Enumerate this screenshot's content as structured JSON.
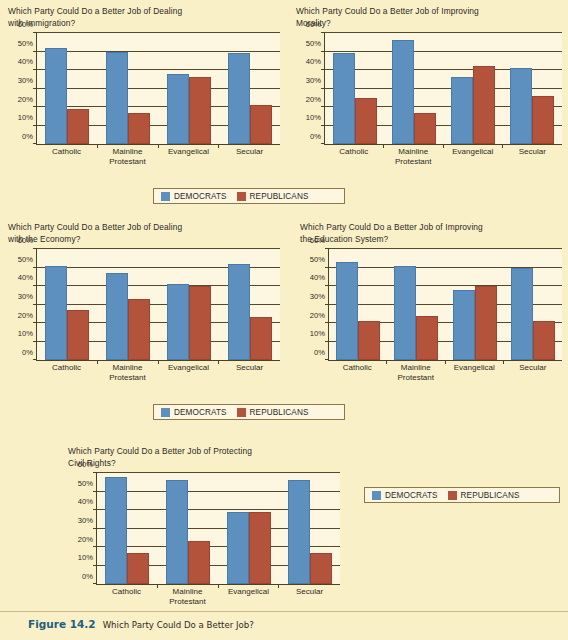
{
  "figure": {
    "number_label": "Figure 14.2",
    "caption": "Which Party Could Do a Better Job?"
  },
  "legend": {
    "democrats_label": "DEMOCRATS",
    "republicans_label": "REPUBLICANS",
    "democrats_color": "#5d8fbf",
    "republicans_color": "#b4533c"
  },
  "axis": {
    "y_ticks": [
      "60%",
      "50%",
      "40%",
      "30%",
      "20%",
      "10%",
      "0%"
    ],
    "y_min": 0,
    "y_max": 60,
    "categories": [
      "Catholic",
      "Mainline\nProtestant",
      "Evangelical",
      "Secular"
    ]
  },
  "chart_data": [
    {
      "type": "bar",
      "id": "immigration",
      "title": "Which Party Could Do a Better Job of Dealing\nwith Immigration?",
      "categories": [
        "Catholic",
        "Mainline\nProtestant",
        "Evangelical",
        "Secular"
      ],
      "series": [
        {
          "name": "DEMOCRATS",
          "color": "#5d8fbf",
          "values": [
            52,
            50,
            38,
            49
          ]
        },
        {
          "name": "REPUBLICANS",
          "color": "#b4533c",
          "values": [
            19,
            17,
            36,
            21
          ]
        }
      ],
      "xlabel": "",
      "ylabel": "",
      "ylim": [
        0,
        60
      ],
      "yticks": [
        0,
        10,
        20,
        30,
        40,
        50,
        60
      ],
      "grid": true,
      "legend_position": "below-center"
    },
    {
      "type": "bar",
      "id": "morality",
      "title": "Which Party Could Do a Better Job of  Improving\nMorality?",
      "categories": [
        "Catholic",
        "Mainline\nProtestant",
        "Evangelical",
        "Secular"
      ],
      "series": [
        {
          "name": "DEMOCRATS",
          "color": "#5d8fbf",
          "values": [
            49,
            56,
            36,
            41
          ]
        },
        {
          "name": "REPUBLICANS",
          "color": "#b4533c",
          "values": [
            25,
            17,
            42,
            26
          ]
        }
      ],
      "xlabel": "",
      "ylabel": "",
      "ylim": [
        0,
        60
      ],
      "yticks": [
        0,
        10,
        20,
        30,
        40,
        50,
        60
      ],
      "grid": true,
      "legend_position": "below-center"
    },
    {
      "type": "bar",
      "id": "economy",
      "title": "Which Party Could Do a Better Job of Dealing\nwith the Economy?",
      "categories": [
        "Catholic",
        "Mainline\nProtestant",
        "Evangelical",
        "Secular"
      ],
      "series": [
        {
          "name": "DEMOCRATS",
          "color": "#5d8fbf",
          "values": [
            51,
            47,
            41,
            52
          ]
        },
        {
          "name": "REPUBLICANS",
          "color": "#b4533c",
          "values": [
            27,
            33,
            40,
            23
          ]
        }
      ],
      "xlabel": "",
      "ylabel": "",
      "ylim": [
        0,
        60
      ],
      "yticks": [
        0,
        10,
        20,
        30,
        40,
        50,
        60
      ],
      "grid": true,
      "legend_position": "below-center"
    },
    {
      "type": "bar",
      "id": "education",
      "title": "Which Party Could Do a  Better Job of  Improving\nthe  Education System?",
      "categories": [
        "Catholic",
        "Mainline\nProtestant",
        "Evangelical",
        "Secular"
      ],
      "series": [
        {
          "name": "DEMOCRATS",
          "color": "#5d8fbf",
          "values": [
            53,
            51,
            38,
            50
          ]
        },
        {
          "name": "REPUBLICANS",
          "color": "#b4533c",
          "values": [
            21,
            24,
            40,
            21
          ]
        }
      ],
      "xlabel": "",
      "ylabel": "",
      "ylim": [
        0,
        60
      ],
      "yticks": [
        0,
        10,
        20,
        30,
        40,
        50,
        60
      ],
      "grid": true,
      "legend_position": "below-center"
    },
    {
      "type": "bar",
      "id": "civil-rights",
      "title": "Which Party Could Do a Better Job of Protecting\nCivil Rights?",
      "categories": [
        "Catholic",
        "Mainline\nProtestant",
        "Evangelical",
        "Secular"
      ],
      "series": [
        {
          "name": "DEMOCRATS",
          "color": "#5d8fbf",
          "values": [
            58,
            56,
            39,
            56
          ]
        },
        {
          "name": "REPUBLICANS",
          "color": "#b4533c",
          "values": [
            17,
            23,
            39,
            17
          ]
        }
      ],
      "xlabel": "",
      "ylabel": "",
      "ylim": [
        0,
        60
      ],
      "yticks": [
        0,
        10,
        20,
        30,
        40,
        50,
        60
      ],
      "grid": true,
      "legend_position": "right"
    }
  ]
}
